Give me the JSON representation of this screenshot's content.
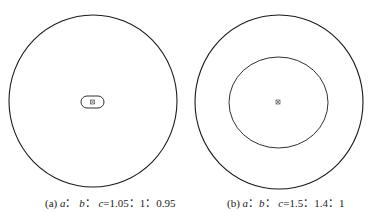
{
  "panels": [
    {
      "id": "a",
      "label": "(a)",
      "ratio_text": "a： b： c=1.05：1：0.95",
      "caption_prefix": "(a) ",
      "var_a": "a",
      "sep1": "： ",
      "var_b": "b",
      "sep2": "： ",
      "var_c": "c",
      "values": "=1.05：1：0.95",
      "ratio": [
        1.05,
        1,
        0.95
      ],
      "outer_circle": {
        "cx": 93,
        "cy": 101,
        "rx": 84,
        "ry": 86
      },
      "inner_shape": {
        "type": "rounded-rect",
        "x": 81,
        "y": 96,
        "w": 23,
        "h": 12
      },
      "center_marker": {
        "x": 92.5,
        "y": 102
      }
    },
    {
      "id": "b",
      "label": "(b)",
      "caption_prefix": "(b) ",
      "var_a": "a",
      "sep1": "：",
      "var_b": "b",
      "sep2": "： ",
      "var_c": "c",
      "values": "=1.5：1.4：1",
      "ratio": [
        1.5,
        1.4,
        1
      ],
      "outer_circle": {
        "cx": 279,
        "cy": 102,
        "rx": 84,
        "ry": 87
      },
      "inner_shape": {
        "type": "ellipse",
        "cx": 278.5,
        "cy": 102.5,
        "rx": 49.5,
        "ry": 45.5
      },
      "center_marker": {
        "x": 278,
        "y": 102
      }
    }
  ],
  "colors": {
    "stroke": "#1a1a1a",
    "marker": "#555555",
    "background": "#ffffff"
  }
}
